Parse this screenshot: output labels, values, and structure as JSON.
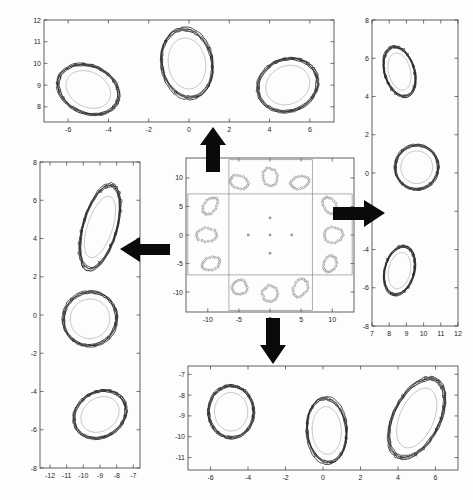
{
  "figure": {
    "title": "",
    "background_color": "#fdfdfd",
    "contour_color": "#1a1a1a",
    "inner_ellipse_color": "#b9b9b9",
    "zoombox_color": "#8d8d8d",
    "arrow_color": "#0a0a0a"
  },
  "arrows": [
    {
      "name": "arrow-up",
      "direction": "up",
      "glyph": "▲"
    },
    {
      "name": "arrow-left",
      "direction": "left",
      "glyph": "◀"
    },
    {
      "name": "arrow-right",
      "direction": "right",
      "glyph": "▶"
    },
    {
      "name": "arrow-down",
      "direction": "down",
      "glyph": "▼"
    }
  ],
  "chart_data": [
    {
      "type": "scatter",
      "name": "center-overview",
      "title": "",
      "xlabel": "",
      "ylabel": "",
      "xlim": [
        -13.5,
        13.5
      ],
      "ylim": [
        -13.5,
        13.5
      ],
      "xticks": [
        -10,
        -5,
        0,
        5,
        10
      ],
      "xticklabels": [
        "-10",
        "-5",
        "0",
        "5",
        "10"
      ],
      "yticks": [
        -10,
        -5,
        0,
        5,
        10
      ],
      "yticklabels": [
        "-10",
        "-5",
        "0",
        "5",
        "10"
      ],
      "grid": false,
      "legend": "none",
      "clusters": [
        {
          "cx": -5.0,
          "cy": 9.3,
          "rx": 1.5,
          "ry": 1.1,
          "rot": -25
        },
        {
          "cx": 0.0,
          "cy": 10.2,
          "rx": 1.2,
          "ry": 1.5,
          "rot": 10
        },
        {
          "cx": 4.8,
          "cy": 9.2,
          "rx": 1.5,
          "ry": 1.1,
          "rot": 20
        },
        {
          "cx": -9.6,
          "cy": 5.1,
          "rx": 1.0,
          "ry": 1.6,
          "rot": -30
        },
        {
          "cx": -10.2,
          "cy": 0.0,
          "rx": 1.6,
          "ry": 1.2,
          "rot": 0
        },
        {
          "cx": -9.5,
          "cy": -5.0,
          "rx": 1.5,
          "ry": 1.1,
          "rot": 25
        },
        {
          "cx": -4.9,
          "cy": -9.2,
          "rx": 1.2,
          "ry": 1.3,
          "rot": 0
        },
        {
          "cx": 0.0,
          "cy": -10.3,
          "rx": 1.2,
          "ry": 1.4,
          "rot": 0
        },
        {
          "cx": 4.9,
          "cy": -9.3,
          "rx": 1.1,
          "ry": 1.6,
          "rot": -25
        },
        {
          "cx": 9.6,
          "cy": 5.2,
          "rx": 1.0,
          "ry": 1.5,
          "rot": 25
        },
        {
          "cx": 10.2,
          "cy": 0.0,
          "rx": 1.5,
          "ry": 1.3,
          "rot": 0
        },
        {
          "cx": 9.6,
          "cy": -5.1,
          "rx": 1.0,
          "ry": 1.5,
          "rot": -20
        }
      ],
      "center_points": [
        {
          "x": 0.0,
          "y": 3.0
        },
        {
          "x": -3.5,
          "y": 0.0
        },
        {
          "x": 0.0,
          "y": 0.0
        },
        {
          "x": 3.5,
          "y": 0.0
        },
        {
          "x": 0.0,
          "y": -3.2
        }
      ],
      "zoom_boxes": [
        {
          "name": "zoombox-top",
          "x0": -6.6,
          "y0": 7.2,
          "x1": 6.8,
          "y1": 13.2
        },
        {
          "name": "zoombox-left",
          "x0": -13.2,
          "y0": -7.0,
          "x1": -6.6,
          "y1": 7.2
        },
        {
          "name": "zoombox-right",
          "x0": 6.8,
          "y0": -7.0,
          "x1": 13.2,
          "y1": 7.2
        },
        {
          "name": "zoombox-bottom",
          "x0": -6.6,
          "y0": -13.2,
          "x1": 6.8,
          "y1": -7.0
        }
      ]
    },
    {
      "type": "scatter",
      "name": "detail-top",
      "title": "",
      "xlabel": "",
      "ylabel": "",
      "xlim": [
        -7.2,
        7.2
      ],
      "ylim": [
        7.3,
        12.0
      ],
      "xticks": [
        -6,
        -4,
        -2,
        0,
        2,
        4,
        6
      ],
      "xticklabels": [
        "-6",
        "-4",
        "-2",
        "0",
        "2",
        "4",
        "6"
      ],
      "yticks": [
        8,
        9,
        10,
        11,
        12
      ],
      "yticklabels": [
        "8",
        "9",
        "10",
        "11",
        "12"
      ],
      "grid": false,
      "legend": "none",
      "clusters": [
        {
          "cx": -5.0,
          "cy": 8.8,
          "rx": 1.55,
          "ry": 1.1,
          "rot": -22
        },
        {
          "cx": -0.1,
          "cy": 10.0,
          "rx": 1.25,
          "ry": 1.6,
          "rot": 12
        },
        {
          "cx": 4.9,
          "cy": 9.0,
          "rx": 1.5,
          "ry": 1.2,
          "rot": 18
        }
      ]
    },
    {
      "type": "scatter",
      "name": "detail-left",
      "title": "",
      "xlabel": "",
      "ylabel": "",
      "xlim": [
        -12.6,
        -6.6
      ],
      "ylim": [
        -8,
        8
      ],
      "xticks": [
        -12,
        -11,
        -10,
        -9,
        -8,
        -7
      ],
      "xticklabels": [
        "-12",
        "-11",
        "-10",
        "-9",
        "-8",
        "-7"
      ],
      "yticks": [
        -8,
        -6,
        -4,
        -2,
        0,
        2,
        4,
        6,
        8
      ],
      "yticklabels": [
        "-8",
        "-6",
        "-4",
        "-2",
        "0",
        "2",
        "4",
        "6",
        "8"
      ],
      "grid": false,
      "legend": "none",
      "clusters": [
        {
          "cx": -9.0,
          "cy": 4.6,
          "rx": 1.0,
          "ry": 2.3,
          "rot": -22
        },
        {
          "cx": -9.6,
          "cy": -0.2,
          "rx": 1.6,
          "ry": 1.4,
          "rot": 3
        },
        {
          "cx": -9.0,
          "cy": -5.2,
          "rx": 1.6,
          "ry": 1.2,
          "rot": 22
        }
      ]
    },
    {
      "type": "scatter",
      "name": "detail-right",
      "title": "",
      "xlabel": "",
      "ylabel": "",
      "xlim": [
        7,
        12
      ],
      "ylim": [
        -8,
        8
      ],
      "xticks": [
        7,
        8,
        9,
        10,
        11,
        12
      ],
      "xticklabels": [
        "7",
        "8",
        "9",
        "10",
        "11",
        "12"
      ],
      "yticks": [
        -8,
        -6,
        -4,
        -2,
        0,
        2,
        4,
        6,
        8
      ],
      "yticklabels": [
        "-8",
        "-6",
        "-4",
        "-2",
        "0",
        "2",
        "4",
        "6",
        "8"
      ],
      "grid": false,
      "legend": "none",
      "clusters": [
        {
          "cx": 8.6,
          "cy": 5.3,
          "rx": 0.85,
          "ry": 1.35,
          "rot": 18
        },
        {
          "cx": 9.6,
          "cy": 0.3,
          "rx": 1.25,
          "ry": 1.15,
          "rot": 0
        },
        {
          "cx": 8.6,
          "cy": -5.1,
          "rx": 0.85,
          "ry": 1.3,
          "rot": -15
        }
      ]
    },
    {
      "type": "scatter",
      "name": "detail-bottom",
      "title": "",
      "xlabel": "",
      "ylabel": "",
      "xlim": [
        -7.2,
        7.2
      ],
      "ylim": [
        -11.6,
        -6.6
      ],
      "xticks": [
        -6,
        -4,
        -2,
        0,
        2,
        4,
        6
      ],
      "xticklabels": [
        "-6",
        "-4",
        "-2",
        "0",
        "2",
        "4",
        "6"
      ],
      "yticks": [
        -11,
        -10,
        -9,
        -8,
        -7
      ],
      "yticklabels": [
        "-11",
        "-10",
        "-9",
        "-8",
        "-7"
      ],
      "grid": false,
      "legend": "none",
      "clusters": [
        {
          "cx": -4.9,
          "cy": -8.8,
          "rx": 1.2,
          "ry": 1.25,
          "rot": 5
        },
        {
          "cx": 0.2,
          "cy": -9.7,
          "rx": 1.05,
          "ry": 1.55,
          "rot": 4
        },
        {
          "cx": 5.0,
          "cy": -9.1,
          "rx": 1.2,
          "ry": 2.1,
          "rot": -28
        }
      ]
    }
  ]
}
